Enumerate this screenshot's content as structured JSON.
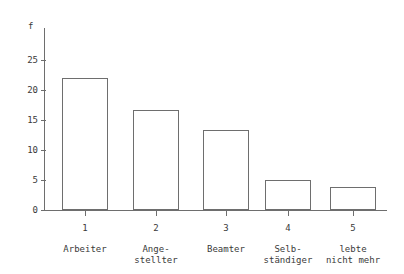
{
  "chart_data": {
    "type": "bar",
    "title": "",
    "xlabel": "",
    "ylabel": "f",
    "categories": [
      "1",
      "2",
      "3",
      "4",
      "5"
    ],
    "category_labels": [
      "Arbeiter",
      "Ange-\nstellter",
      "Beamter",
      "Selb-\nständiger",
      "lebte\nnicht mehr"
    ],
    "values": [
      22,
      16.7,
      13.3,
      5,
      3.8
    ],
    "ylim": [
      0,
      26
    ],
    "yticks": [
      0,
      5,
      10,
      15,
      20,
      25
    ],
    "ytick_labels": [
      "0",
      "5",
      "10",
      "15",
      "20",
      "25"
    ],
    "grid": false,
    "legend": false,
    "bar_fill": "#ffffff",
    "bar_stroke": "#6e6e6e",
    "axis_color": "#6e6e6e",
    "text_color": "#3a3a3a",
    "background": "#ffffff"
  }
}
